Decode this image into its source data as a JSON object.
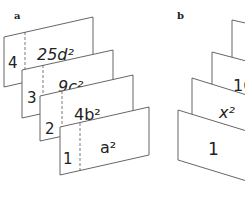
{
  "panels": {
    "a": {
      "label": "a",
      "cards": [
        {
          "number": "4",
          "term": "25d²"
        },
        {
          "number": "3",
          "term": "9c²"
        },
        {
          "number": "2",
          "term": "4b²"
        },
        {
          "number": "1",
          "term": "a²"
        }
      ]
    },
    "b": {
      "label": "b",
      "cards": [
        {
          "term": ""
        },
        {
          "term": "16"
        },
        {
          "term": "x²"
        },
        {
          "term": "1"
        }
      ]
    }
  },
  "colors": {
    "stroke": "#555555",
    "text": "#222222",
    "background": "#ffffff"
  }
}
